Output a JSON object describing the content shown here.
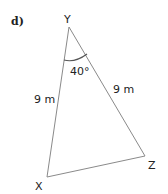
{
  "part_label": "d)",
  "vertices": {
    "Y": {
      "label": "Y",
      "x": 69,
      "y": 27
    },
    "X": {
      "label": "X",
      "x": 47,
      "y": 177
    },
    "Z": {
      "label": "Z",
      "x": 145,
      "y": 156
    }
  },
  "sides": {
    "XY": "9 m",
    "YZ": "9 m"
  },
  "angle_Y": "40°",
  "colors": {
    "line": "#8a8a8a",
    "text": "#222222",
    "arc": "#555555"
  }
}
